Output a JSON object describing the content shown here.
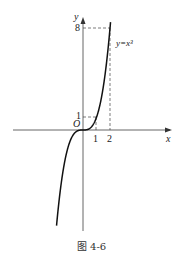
{
  "chart_data": {
    "type": "line",
    "title": "",
    "caption": "图 4-6",
    "xlabel": "x",
    "ylabel": "y",
    "origin_label": "O",
    "curve_label": "y=x³",
    "x_ticks": [
      "1",
      "2"
    ],
    "y_ticks": [
      "1",
      "8"
    ],
    "series": [
      {
        "name": "y=x^3",
        "x": [
          -2.2,
          -2,
          -1.5,
          -1,
          -0.5,
          0,
          0.5,
          1,
          1.5,
          2,
          2.1
        ],
        "values": [
          -10.6,
          -8,
          -3.375,
          -1,
          -0.125,
          0,
          0.125,
          1,
          3.375,
          8,
          9.26
        ]
      }
    ],
    "guides": [
      {
        "type": "dashed",
        "from": [
          0,
          1
        ],
        "to": [
          1,
          1
        ]
      },
      {
        "type": "dashed",
        "from": [
          1,
          0
        ],
        "to": [
          1,
          1
        ]
      },
      {
        "type": "dashed",
        "from": [
          0,
          8
        ],
        "to": [
          2,
          8
        ]
      },
      {
        "type": "dashed",
        "from": [
          2,
          0
        ],
        "to": [
          2,
          8
        ]
      }
    ],
    "grid": false
  }
}
